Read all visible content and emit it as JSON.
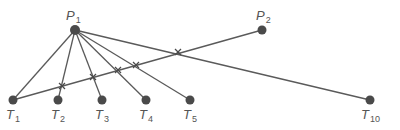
{
  "diagram": {
    "type": "line-crossing-diagram",
    "colors": {
      "line": "#5a5a5a",
      "node": "#4a4a4a",
      "label": "#555555"
    },
    "nodes": [
      {
        "id": "P1",
        "letter": "P",
        "sub": "1",
        "x": 75,
        "y": 30,
        "lx": 66,
        "ly": 20
      },
      {
        "id": "P2",
        "letter": "P",
        "sub": "2",
        "x": 262,
        "y": 30,
        "lx": 256,
        "ly": 20
      },
      {
        "id": "T1",
        "letter": "T",
        "sub": "1",
        "x": 13,
        "y": 100,
        "lx": 6,
        "ly": 119
      },
      {
        "id": "T2",
        "letter": "T",
        "sub": "2",
        "x": 58,
        "y": 100,
        "lx": 51,
        "ly": 119
      },
      {
        "id": "T3",
        "letter": "T",
        "sub": "3",
        "x": 102,
        "y": 100,
        "lx": 95,
        "ly": 119
      },
      {
        "id": "T4",
        "letter": "T",
        "sub": "4",
        "x": 146,
        "y": 100,
        "lx": 139,
        "ly": 119
      },
      {
        "id": "T5",
        "letter": "T",
        "sub": "5",
        "x": 190,
        "y": 100,
        "lx": 183,
        "ly": 119
      },
      {
        "id": "T10",
        "letter": "T",
        "sub": "10",
        "x": 370,
        "y": 100,
        "lx": 361,
        "ly": 119
      }
    ],
    "edges": [
      {
        "from": "P1",
        "to": "T1"
      },
      {
        "from": "P1",
        "to": "T2"
      },
      {
        "from": "P1",
        "to": "T3"
      },
      {
        "from": "P1",
        "to": "T4"
      },
      {
        "from": "P1",
        "to": "T5"
      },
      {
        "from": "P1",
        "to": "T10"
      },
      {
        "from": "P2",
        "to": "T1"
      }
    ],
    "crossings": [
      {
        "x": 62,
        "y": 86
      },
      {
        "x": 93,
        "y": 77
      },
      {
        "x": 118,
        "y": 70
      },
      {
        "x": 136,
        "y": 65
      },
      {
        "x": 178,
        "y": 52
      }
    ]
  }
}
